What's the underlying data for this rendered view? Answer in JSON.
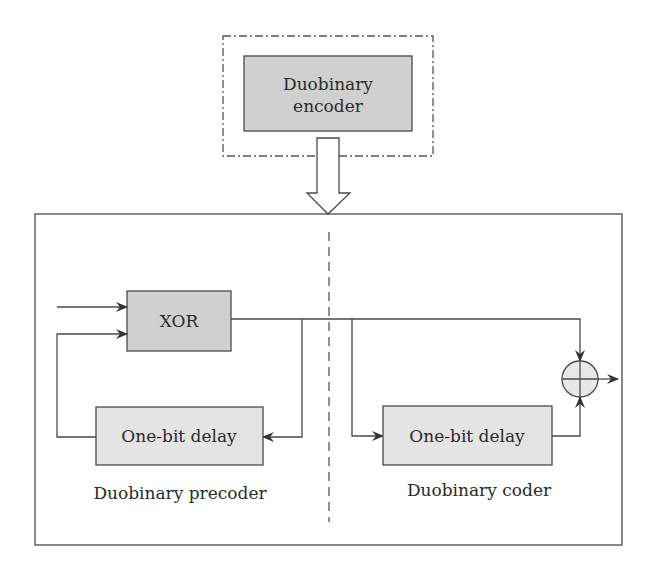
{
  "diagram": {
    "encoder_block": {
      "label_line1": "Duobinary",
      "label_line2": "encoder"
    },
    "xor_block": {
      "label": "XOR"
    },
    "precoder_delay": {
      "label": "One-bit delay"
    },
    "coder_delay": {
      "label": "One-bit delay"
    },
    "precoder_caption": "Duobinary precoder",
    "coder_caption": "Duobinary coder",
    "adder_symbol": "⊕",
    "colors": {
      "line": "#4a4a4a",
      "dark_fill": "#d0d0d0",
      "light_fill": "#e4e4e4",
      "text": "#2a2a2a"
    }
  }
}
